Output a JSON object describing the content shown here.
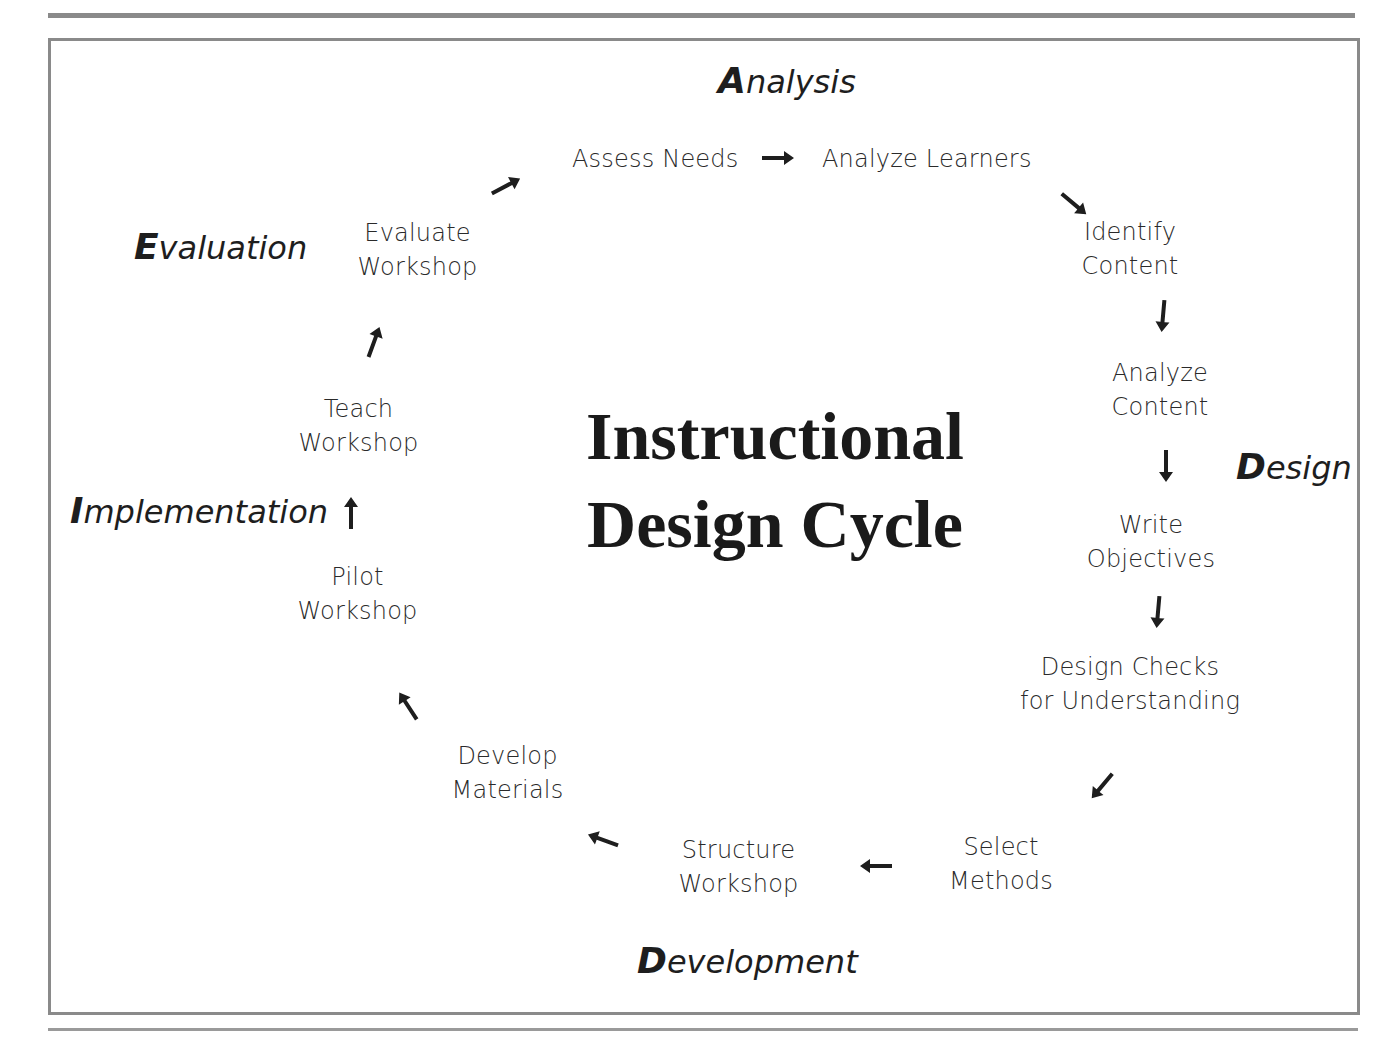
{
  "diagram": {
    "title_line1": "Instructional",
    "title_line2": "Design Cycle",
    "phases": {
      "analysis": {
        "cap": "A",
        "rest": "nalysis"
      },
      "design": {
        "cap": "D",
        "rest": "esign"
      },
      "development": {
        "cap": "D",
        "rest": "evelopment"
      },
      "implementation": {
        "cap": "I",
        "rest": "mplementation"
      },
      "evaluation": {
        "cap": "E",
        "rest": "valuation"
      }
    },
    "steps": [
      {
        "line1": "Assess Needs",
        "line2": ""
      },
      {
        "line1": "Analyze Learners",
        "line2": ""
      },
      {
        "line1": "Identify",
        "line2": "Content"
      },
      {
        "line1": "Analyze",
        "line2": "Content"
      },
      {
        "line1": "Write",
        "line2": "Objectives"
      },
      {
        "line1": "Design Checks",
        "line2": "for Understanding"
      },
      {
        "line1": "Select",
        "line2": "Methods"
      },
      {
        "line1": "Structure",
        "line2": "Workshop"
      },
      {
        "line1": "Develop",
        "line2": "Materials"
      },
      {
        "line1": "Pilot",
        "line2": "Workshop"
      },
      {
        "line1": "Teach",
        "line2": "Workshop"
      },
      {
        "line1": "Evaluate",
        "line2": "Workshop"
      }
    ],
    "arrows": [
      {
        "from": "Assess Needs",
        "to": "Analyze Learners",
        "direction": "right"
      },
      {
        "from": "Analyze Learners",
        "to": "Identify Content",
        "direction": "down-right"
      },
      {
        "from": "Identify Content",
        "to": "Analyze Content",
        "direction": "down"
      },
      {
        "from": "Analyze Content",
        "to": "Write Objectives",
        "direction": "down"
      },
      {
        "from": "Write Objectives",
        "to": "Design Checks for Understanding",
        "direction": "down"
      },
      {
        "from": "Design Checks for Understanding",
        "to": "Select Methods",
        "direction": "down-left"
      },
      {
        "from": "Select Methods",
        "to": "Structure Workshop",
        "direction": "left"
      },
      {
        "from": "Structure Workshop",
        "to": "Develop Materials",
        "direction": "up-left"
      },
      {
        "from": "Develop Materials",
        "to": "Pilot Workshop",
        "direction": "up-left"
      },
      {
        "from": "Pilot Workshop",
        "to": "Teach Workshop",
        "direction": "up"
      },
      {
        "from": "Teach Workshop",
        "to": "Evaluate Workshop",
        "direction": "up-right"
      },
      {
        "from": "Evaluate Workshop",
        "to": "Assess Needs",
        "direction": "up-right"
      }
    ],
    "colors": {
      "text": "#1e1e1e",
      "rule": "#8a8a8a",
      "background": "#ffffff"
    }
  }
}
